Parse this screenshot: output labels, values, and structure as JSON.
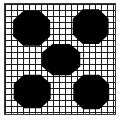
{
  "figure": {
    "title": "",
    "background_color": "#ffffff",
    "frame": {
      "border_color": "#3a3a3a",
      "border_width_px": 1,
      "x_px": 4,
      "y_px": 3,
      "width_px": 112,
      "height_px": 112
    },
    "grid": {
      "line_color": "#1c1c1c",
      "line_width_px": 1,
      "cell_size_px": 6,
      "columns": 19,
      "rows": 19,
      "visible": "true"
    },
    "marks": {
      "fill_color": "#000000",
      "shape_name": "rounded-octagon-blob",
      "count_label": "5",
      "arrangement_label": "quincunx"
    }
  },
  "chart_data": {
    "type": "scatter",
    "title": "",
    "subtitle": "",
    "xlabel": "",
    "ylabel": "",
    "xlim": [
      0,
      19
    ],
    "ylim": [
      0,
      19
    ],
    "grid": true,
    "legend_position": "none",
    "tick_labels_x": [],
    "tick_labels_y": [],
    "annotations": [],
    "series": [
      {
        "name": "blobs",
        "marker": "rounded-octagon-blob",
        "color": "#000000",
        "points": [
          {
            "label": "top-left",
            "x": 4.6,
            "y": 14.8,
            "rx": 3.2,
            "ry": 3.0
          },
          {
            "label": "top-right",
            "x": 14.8,
            "y": 15.1,
            "rx": 3.1,
            "ry": 3.0
          },
          {
            "label": "center",
            "x": 9.7,
            "y": 9.4,
            "rx": 3.3,
            "ry": 2.7
          },
          {
            "label": "bottom-left",
            "x": 4.7,
            "y": 3.9,
            "rx": 3.2,
            "ry": 2.9
          },
          {
            "label": "bottom-right",
            "x": 14.9,
            "y": 3.8,
            "rx": 3.1,
            "ry": 3.0
          }
        ]
      }
    ]
  }
}
